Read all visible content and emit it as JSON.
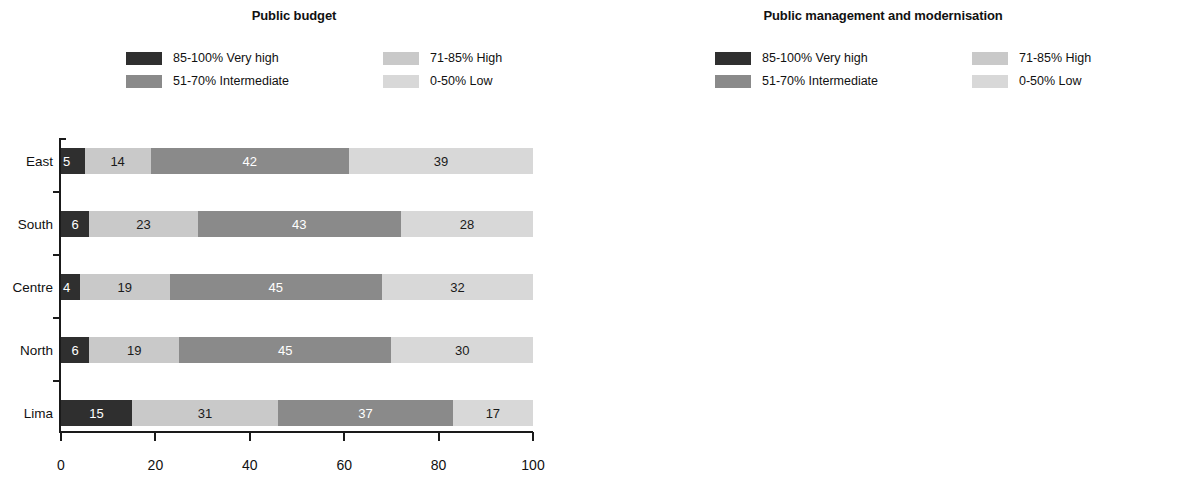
{
  "palette": {
    "very_high": "#2f2f2f",
    "intermediate": "#8a8a8a",
    "high": "#c9c9c9",
    "low": "#d8d8d8",
    "axis": "#1a1a1a",
    "background": "#ffffff"
  },
  "legend_keys": [
    {
      "id": "very_high",
      "label": "85-100% Very high",
      "color": "#2f2f2f"
    },
    {
      "id": "intermediate",
      "label": "51-70% Intermediate",
      "color": "#8a8a8a"
    },
    {
      "id": "high",
      "label": "71-85% High",
      "color": "#c9c9c9"
    },
    {
      "id": "low",
      "label": "0-50% Low",
      "color": "#d8d8d8"
    }
  ],
  "chart_data": [
    {
      "type": "bar",
      "subtype": "stacked-horizontal-100",
      "title": "Public budget",
      "xlabel": "",
      "ylabel": "",
      "xlim": [
        0,
        100
      ],
      "xticks": [
        0,
        20,
        40,
        60,
        80,
        100
      ],
      "xtick_labels": [
        "0",
        "20",
        "40",
        "60",
        "80",
        "100"
      ],
      "grid": false,
      "legend_position": "top",
      "categories": [
        "East",
        "South",
        "Centre",
        "North",
        "Lima"
      ],
      "series": [
        {
          "name": "85-100% Very high",
          "id": "very_high",
          "values": [
            5,
            6,
            4,
            6,
            15
          ]
        },
        {
          "name": "71-85% High",
          "id": "high",
          "values": [
            14,
            23,
            19,
            19,
            31
          ]
        },
        {
          "name": "51-70% Intermediate",
          "id": "intermediate",
          "values": [
            42,
            43,
            45,
            45,
            37
          ]
        },
        {
          "name": "0-50% Low",
          "id": "low",
          "values": [
            39,
            28,
            32,
            30,
            17
          ]
        }
      ],
      "rows": [
        {
          "label": "East",
          "segments": [
            {
              "id": "very_high",
              "value": 5,
              "label": "5"
            },
            {
              "id": "high",
              "value": 14,
              "label": "14"
            },
            {
              "id": "intermediate",
              "value": 42,
              "label": "42"
            },
            {
              "id": "low",
              "value": 39,
              "label": "39"
            }
          ]
        },
        {
          "label": "South",
          "segments": [
            {
              "id": "very_high",
              "value": 6,
              "label": "6"
            },
            {
              "id": "high",
              "value": 23,
              "label": "23"
            },
            {
              "id": "intermediate",
              "value": 43,
              "label": "43"
            },
            {
              "id": "low",
              "value": 28,
              "label": "28"
            }
          ]
        },
        {
          "label": "Centre",
          "segments": [
            {
              "id": "very_high",
              "value": 4,
              "label": "4"
            },
            {
              "id": "high",
              "value": 19,
              "label": "19"
            },
            {
              "id": "intermediate",
              "value": 45,
              "label": "45"
            },
            {
              "id": "low",
              "value": 32,
              "label": "32"
            }
          ]
        },
        {
          "label": "North",
          "segments": [
            {
              "id": "very_high",
              "value": 6,
              "label": "6"
            },
            {
              "id": "high",
              "value": 19,
              "label": "19"
            },
            {
              "id": "intermediate",
              "value": 45,
              "label": "45"
            },
            {
              "id": "low",
              "value": 30,
              "label": "30"
            }
          ]
        },
        {
          "label": "Lima",
          "segments": [
            {
              "id": "very_high",
              "value": 15,
              "label": "15"
            },
            {
              "id": "high",
              "value": 31,
              "label": "31"
            },
            {
              "id": "intermediate",
              "value": 37,
              "label": "37"
            },
            {
              "id": "low",
              "value": 17,
              "label": "17"
            }
          ]
        }
      ],
      "annotations": []
    },
    {
      "type": "bar",
      "subtype": "stacked-horizontal-100",
      "title": "Public management and modernisation",
      "xlabel": "",
      "ylabel": "",
      "xlim": [
        0,
        100
      ],
      "xticks": [
        0,
        20,
        40,
        60,
        80,
        100
      ],
      "xtick_labels": [
        "0",
        "20",
        "40",
        "60",
        "80",
        "100"
      ],
      "grid": false,
      "legend_position": "top",
      "categories": [
        "East",
        "South",
        "Centre",
        "North",
        "Lima"
      ],
      "series": [
        {
          "name": "85-100% Very high",
          "id": "very_high",
          "values": [
            0,
            1,
            0,
            0,
            3
          ]
        },
        {
          "name": "71-85% High",
          "id": "high",
          "values": [
            3,
            7,
            3,
            9,
            20
          ]
        },
        {
          "name": "51-70% Intermediate",
          "id": "intermediate",
          "values": [
            38,
            45,
            42,
            45,
            45
          ]
        },
        {
          "name": "0-50% Low",
          "id": "low",
          "values": [
            59,
            47,
            55,
            46,
            32
          ]
        }
      ],
      "rows": [
        {
          "label": "East",
          "segments": [
            {
              "id": "high",
              "value": 3,
              "label": "3"
            },
            {
              "id": "intermediate",
              "value": 38,
              "label": "38"
            },
            {
              "id": "low",
              "value": 59,
              "label": "59"
            }
          ]
        },
        {
          "label": "South",
          "segments": [
            {
              "id": "very_high",
              "value": 1,
              "label": ""
            },
            {
              "id": "high",
              "value": 7,
              "label": "7"
            },
            {
              "id": "intermediate",
              "value": 45,
              "label": "45"
            },
            {
              "id": "low",
              "value": 47,
              "label": "47"
            }
          ]
        },
        {
          "label": "Centre",
          "segments": [
            {
              "id": "high",
              "value": 3,
              "label": "3"
            },
            {
              "id": "intermediate",
              "value": 42,
              "label": "42"
            },
            {
              "id": "low",
              "value": 55,
              "label": "55"
            }
          ]
        },
        {
          "label": "North",
          "segments": [
            {
              "id": "high",
              "value": 9,
              "label": "9"
            },
            {
              "id": "intermediate",
              "value": 45,
              "label": "45"
            },
            {
              "id": "low",
              "value": 46,
              "label": "46"
            }
          ]
        },
        {
          "label": "Lima",
          "segments": [
            {
              "id": "very_high",
              "value": 3,
              "label": "3"
            },
            {
              "id": "high",
              "value": 20,
              "label": "20"
            },
            {
              "id": "intermediate",
              "value": 45,
              "label": "45"
            },
            {
              "id": "low",
              "value": 32,
              "label": "32"
            }
          ]
        }
      ],
      "annotations": [
        {
          "text": "1",
          "row": "South",
          "row_index": 1,
          "points_to_series": "very_high"
        }
      ]
    }
  ]
}
